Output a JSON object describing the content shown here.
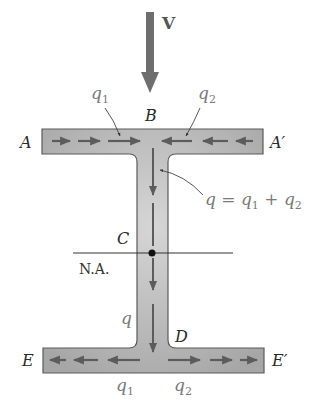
{
  "diagram": {
    "load": {
      "label": "V",
      "icon": "down-arrow-icon",
      "color": "#6e6e6e"
    },
    "points": {
      "A": "A",
      "A_prime": "A′",
      "B": "B",
      "C": "C",
      "D": "D",
      "E": "E",
      "E_prime": "E′"
    },
    "neutral_axis": {
      "label": "N.A."
    },
    "flows": {
      "top_left": {
        "base": "q",
        "sub": "1"
      },
      "top_right": {
        "base": "q",
        "sub": "2"
      },
      "web": {
        "base": "q"
      },
      "equation": {
        "lhs": "q",
        "eq": " = ",
        "t1": "q",
        "t1sub": "1",
        "plus": " + ",
        "t2": "q",
        "t2sub": "2"
      },
      "bottom_left": {
        "base": "q",
        "sub": "1"
      },
      "bottom_right": {
        "base": "q",
        "sub": "2"
      }
    },
    "colors": {
      "section_fill": "#b4b4b4",
      "section_edge": "#5a5a5a",
      "arrow": "#5c5c5c",
      "flow_label": "#7a7a7a",
      "point_label": "#2a2a2a"
    }
  }
}
